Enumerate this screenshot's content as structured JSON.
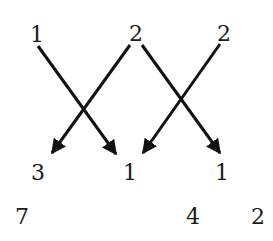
{
  "diagram": {
    "top_row": [
      {
        "label": "1",
        "x": 37,
        "y": 41
      },
      {
        "label": "2",
        "x": 135,
        "y": 40
      },
      {
        "label": "2",
        "x": 224,
        "y": 40
      }
    ],
    "middle_row": [
      {
        "label": "3",
        "x": 38,
        "y": 178
      },
      {
        "label": "1",
        "x": 130,
        "y": 178
      },
      {
        "label": "1",
        "x": 222,
        "y": 178
      }
    ],
    "bottom_row": [
      {
        "label": "7",
        "x": 22,
        "y": 222
      },
      {
        "label": "4",
        "x": 193,
        "y": 222
      },
      {
        "label": "2",
        "x": 259,
        "y": 222
      }
    ],
    "arrows": [
      {
        "from": "top-1",
        "to": "middle-1-left",
        "x1": 38,
        "y1": 46,
        "x2": 116,
        "y2": 154
      },
      {
        "from": "top-2-center",
        "to": "middle-3",
        "x1": 130,
        "y1": 45,
        "x2": 52,
        "y2": 153
      },
      {
        "from": "top-2-center",
        "to": "middle-1-right",
        "x1": 142,
        "y1": 45,
        "x2": 220,
        "y2": 153
      },
      {
        "from": "top-2-right",
        "to": "middle-1-left",
        "x1": 220,
        "y1": 44,
        "x2": 143,
        "y2": 153
      }
    ],
    "stroke_color": "#111111"
  }
}
